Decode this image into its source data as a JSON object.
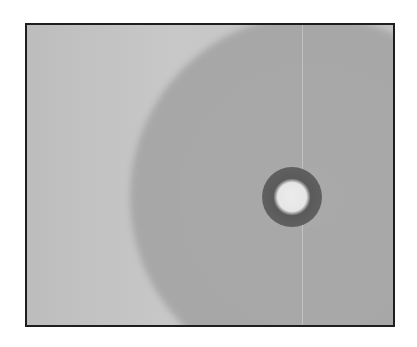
{
  "image": {
    "description": "Grayscale image in a dark rectangular frame: a large medium-gray circular disk extends from the right side over a lighter gray background, with a small dark ring and bright center inside the disk.",
    "colors": {
      "frame_border": "#1e1e1e",
      "background": "#c4c4c4",
      "disk": "#a8a8a8",
      "ring": "#5a5a5a",
      "ring_center": "#ececec"
    },
    "frame": {
      "x": 25,
      "y": 23,
      "width": 370,
      "height": 304
    },
    "disk": {
      "cx": 310,
      "cy": 195,
      "r": 182
    },
    "ring": {
      "cx": 290,
      "cy": 195,
      "outer_r": 28,
      "inner_r": 10
    }
  }
}
